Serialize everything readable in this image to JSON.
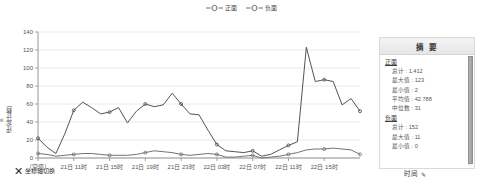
{
  "legend": {
    "items": [
      {
        "label": "正面",
        "color": "#4a4a4a",
        "icon": "circle-marker-line-icon"
      },
      {
        "label": "负面",
        "color": "#4a4a4a",
        "icon": "circle-marker-line-icon"
      }
    ]
  },
  "axes": {
    "y_title": "评论[计数]",
    "y_title_icon": "measure-icon",
    "x_title": "时间",
    "x_title_icon": "edit-pencil-icon",
    "axis_toggle_label": "坐标轴切换",
    "axis_toggle_icon": "swap-axes-x-icon"
  },
  "summary": {
    "title": "摘 要",
    "groups": [
      {
        "name": "正面",
        "stats": [
          "总计 : 1,412",
          "最大值 : 123",
          "最小值 : 2",
          "平均值 : 42.788",
          "中位数 : 31"
        ]
      },
      {
        "name": "负面",
        "stats": [
          "总计 : 152",
          "最大值 : 11",
          "最小值 : 0"
        ]
      }
    ]
  },
  "chart_data": {
    "type": "line",
    "title": "",
    "xlabel": "时间",
    "ylabel": "评论[计数]",
    "ylim": [
      0,
      140
    ],
    "yticks": [
      0,
      20,
      40,
      60,
      80,
      100,
      120,
      140
    ],
    "grid": true,
    "legend_position": "top-center",
    "categories": [
      "（空值）",
      "21日 09时",
      "21日 10时",
      "21日 11时",
      "21日 12时",
      "21日 13时",
      "21日 14时",
      "21日 15时",
      "21日 16时",
      "21日 17时",
      "21日 18时",
      "21日 19时",
      "21日 20时",
      "21日 21时",
      "21日 22时",
      "21日 23时",
      "22日 00时",
      "22日 01时",
      "22日 02时",
      "22日 03时",
      "22日 04时",
      "22日 05时",
      "22日 06时",
      "22日 07时",
      "22日 08时",
      "22日 09时",
      "22日 10时",
      "22日 11时",
      "22日 12时",
      "22日 13时",
      "22日 14时",
      "22日 15时"
    ],
    "xtick_labels": [
      "（空值）",
      "21日 11时",
      "21日 15时",
      "21日 19时",
      "21日 23时",
      "22日 03时",
      "22日 07时",
      "22日 11时",
      "22日 15时"
    ],
    "series": [
      {
        "name": "正面",
        "color": "#4a4a4a",
        "values": [
          22,
          12,
          5,
          27,
          53,
          62,
          56,
          49,
          51,
          56,
          39,
          52,
          60,
          57,
          59,
          72,
          60,
          49,
          48,
          31,
          15,
          8,
          7,
          6,
          8,
          2,
          4,
          9,
          14,
          18,
          123,
          85
        ]
      },
      {
        "name": "负面",
        "color": "#6a6a6a",
        "values": [
          5,
          4,
          2,
          3,
          4,
          5,
          5,
          4,
          3,
          3,
          3,
          4,
          6,
          8,
          7,
          6,
          4,
          3,
          4,
          5,
          4,
          1,
          1,
          2,
          3,
          0,
          1,
          2,
          4,
          6,
          9,
          10
        ]
      }
    ],
    "series_extra_tail": {
      "正面": [
        87,
        85,
        59,
        66,
        52
      ],
      "负面": [
        10,
        11,
        10,
        9,
        4
      ]
    }
  }
}
